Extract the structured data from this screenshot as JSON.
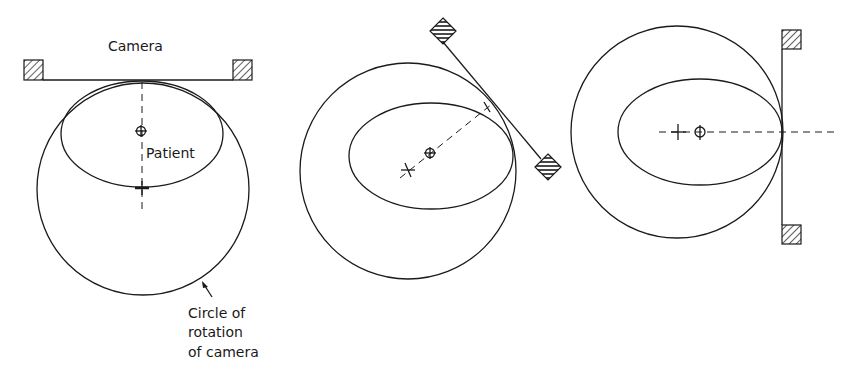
{
  "figure": {
    "panels": [
      {
        "id": "panel-1",
        "orientation": "camera-top",
        "labels": {
          "camera": "Camera",
          "patient": "Patient",
          "circle_line1": "Circle of",
          "circle_line2": "rotation",
          "circle_line3": "of camera"
        }
      },
      {
        "id": "panel-2",
        "orientation": "camera-oblique"
      },
      {
        "id": "panel-3",
        "orientation": "camera-right"
      }
    ],
    "colors": {
      "line": "#1a1a1a",
      "background": "#ffffff"
    }
  }
}
